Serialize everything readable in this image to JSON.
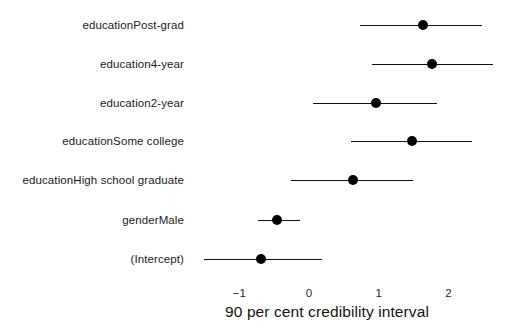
{
  "chart_data": {
    "type": "scatter",
    "plot_style": "coefficient-forest-plot",
    "title": "",
    "xlabel": "90 per cent credibility interval",
    "ylabel": "",
    "xlim": [
      -1.65,
      2.75
    ],
    "xticks": [
      -1,
      0,
      1,
      2
    ],
    "xtick_labels": [
      "−1",
      "0",
      "1",
      "2"
    ],
    "grid": false,
    "legend": null,
    "categories": [
      "educationPost-grad",
      "education4-year",
      "education2-year",
      "educationSome college",
      "educationHigh school graduate",
      "genderMale",
      "(Intercept)"
    ],
    "series": [
      {
        "name": "posterior median",
        "values": [
          1.64,
          1.76,
          0.96,
          1.48,
          0.63,
          -0.46,
          -0.69
        ]
      },
      {
        "name": "lower 5%",
        "values": [
          0.73,
          0.9,
          0.06,
          0.6,
          -0.26,
          -0.73,
          -1.51
        ]
      },
      {
        "name": "upper 95%",
        "values": [
          2.48,
          2.64,
          1.84,
          2.34,
          1.49,
          -0.13,
          0.19
        ]
      }
    ],
    "points": [
      {
        "label": "educationPost-grad",
        "estimate": 1.64,
        "lower": 0.73,
        "upper": 2.48
      },
      {
        "label": "education4-year",
        "estimate": 1.76,
        "lower": 0.9,
        "upper": 2.64
      },
      {
        "label": "education2-year",
        "estimate": 0.96,
        "lower": 0.06,
        "upper": 1.84
      },
      {
        "label": "educationSome college",
        "estimate": 1.48,
        "lower": 0.6,
        "upper": 2.34
      },
      {
        "label": "educationHigh school graduate",
        "estimate": 0.63,
        "lower": -0.26,
        "upper": 1.49
      },
      {
        "label": "genderMale",
        "estimate": -0.46,
        "lower": -0.73,
        "upper": -0.13
      },
      {
        "label": "(Intercept)",
        "estimate": -0.69,
        "lower": -1.51,
        "upper": 0.19
      }
    ],
    "colors": {
      "point": "#000000",
      "line": "#111111",
      "text": "#1a1a1a",
      "background": "#ffffff"
    }
  }
}
